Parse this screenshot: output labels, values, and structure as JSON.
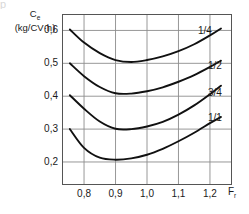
{
  "top_sliver": {
    "text": "p"
  },
  "axes": {
    "y_title_line1": "C",
    "y_title_sub": "e",
    "y_title_line2": "(kg/CV·h)",
    "x_title": "F",
    "x_title_sub": "r"
  },
  "chart_data": {
    "type": "line",
    "title": "",
    "subtitle": "",
    "xlabel": "F r",
    "ylabel": "C e (kg/CV·h)",
    "xlim": [
      0.73,
      1.27
    ],
    "ylim": [
      0.13,
      0.65
    ],
    "xticks": [
      0.8,
      0.9,
      1.0,
      1.1,
      1.2
    ],
    "xticklabels": [
      "0,8",
      "0,9",
      "1,0",
      "1,1",
      "1,2"
    ],
    "yticks": [
      0.2,
      0.3,
      0.4,
      0.5,
      0.6
    ],
    "yticklabels": [
      "0,2",
      "0,3",
      "0,4",
      "0,5",
      "0,6"
    ],
    "grid": true,
    "grid_color": "#8c8c8c",
    "frame_color": "#555555",
    "line_color": "#111111",
    "legend_position": "inline-right-of-curve-end",
    "series": [
      {
        "name": "1/4",
        "label": "1/4",
        "x": [
          0.755,
          0.8,
          0.85,
          0.9,
          0.95,
          1.0,
          1.05,
          1.1,
          1.15,
          1.2,
          1.235
        ],
        "y": [
          0.603,
          0.563,
          0.531,
          0.51,
          0.504,
          0.51,
          0.521,
          0.537,
          0.558,
          0.585,
          0.606
        ]
      },
      {
        "name": "1/2",
        "label": "1/2",
        "x": [
          0.755,
          0.8,
          0.85,
          0.9,
          0.95,
          1.0,
          1.05,
          1.1,
          1.15,
          1.2,
          1.235
        ],
        "y": [
          0.5,
          0.461,
          0.428,
          0.409,
          0.408,
          0.415,
          0.427,
          0.444,
          0.464,
          0.489,
          0.508
        ]
      },
      {
        "name": "3/4",
        "label": "3/4",
        "x": [
          0.755,
          0.8,
          0.85,
          0.9,
          0.95,
          1.0,
          1.05,
          1.1,
          1.15,
          1.2,
          1.235
        ],
        "y": [
          0.403,
          0.362,
          0.323,
          0.301,
          0.3,
          0.308,
          0.322,
          0.344,
          0.372,
          0.406,
          0.432
        ]
      },
      {
        "name": "1/1",
        "label": "1/1",
        "x": [
          0.755,
          0.8,
          0.85,
          0.9,
          0.95,
          1.0,
          1.05,
          1.1,
          1.15,
          1.2,
          1.235
        ],
        "y": [
          0.3,
          0.243,
          0.213,
          0.207,
          0.211,
          0.222,
          0.24,
          0.263,
          0.289,
          0.318,
          0.337
        ]
      }
    ]
  },
  "curve_labels": [
    {
      "text": "1/4",
      "left": 198,
      "top": 26
    },
    {
      "text": "1/2",
      "left": 208,
      "top": 61
    },
    {
      "text": "3/4",
      "left": 208,
      "top": 88
    },
    {
      "text": "1/1",
      "left": 208,
      "top": 113
    }
  ]
}
